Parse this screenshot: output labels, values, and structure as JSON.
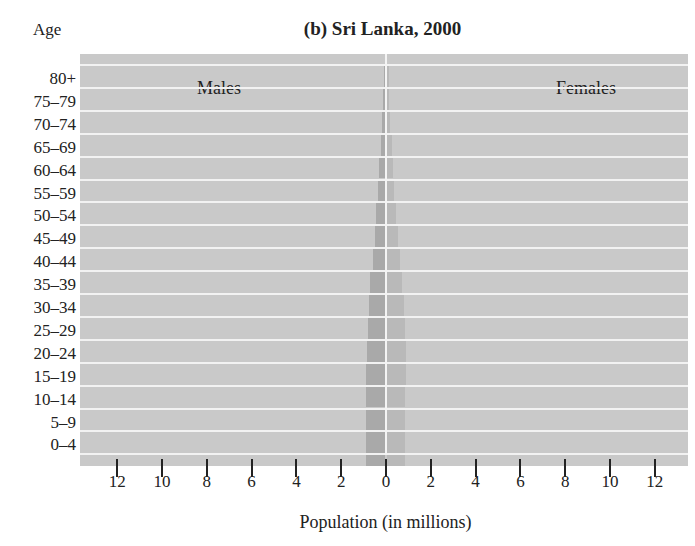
{
  "chart_data": {
    "type": "bar",
    "orientation": "horizontal",
    "subtype": "population-pyramid",
    "title": "(b) Sri Lanka, 2000",
    "ylabel": "Age",
    "xlabel": "Population (in millions)",
    "categories": [
      "0–4",
      "5–9",
      "10–14",
      "15–19",
      "20–24",
      "25–29",
      "30–34",
      "35–39",
      "40–44",
      "45–49",
      "50–54",
      "55–59",
      "60–64",
      "65–69",
      "70–74",
      "75–79",
      "80+"
    ],
    "series": [
      {
        "name": "Males",
        "side": "left",
        "values": [
          0.85,
          0.85,
          0.85,
          0.85,
          0.8,
          0.75,
          0.7,
          0.65,
          0.55,
          0.45,
          0.38,
          0.3,
          0.25,
          0.2,
          0.12,
          0.07,
          0.05
        ]
      },
      {
        "name": "Females",
        "side": "right",
        "values": [
          0.8,
          0.82,
          0.82,
          0.85,
          0.85,
          0.8,
          0.75,
          0.68,
          0.58,
          0.48,
          0.4,
          0.32,
          0.27,
          0.22,
          0.14,
          0.09,
          0.07
        ]
      }
    ],
    "x_ticks_left": [
      "12",
      "10",
      "8",
      "6",
      "4",
      "2",
      "0"
    ],
    "x_ticks_right": [
      "2",
      "4",
      "6",
      "8",
      "10",
      "12"
    ],
    "xlim": [
      -13.5,
      13.5
    ],
    "grid": "horizontal bands",
    "legend": {
      "left_label": "Males",
      "right_label": "Females",
      "position": "top inside"
    }
  },
  "labels": {
    "age_header": "Age",
    "title": "(b) Sri Lanka, 2000",
    "males": "Males",
    "females": "Females",
    "xlabel": "Population (in millions)"
  }
}
